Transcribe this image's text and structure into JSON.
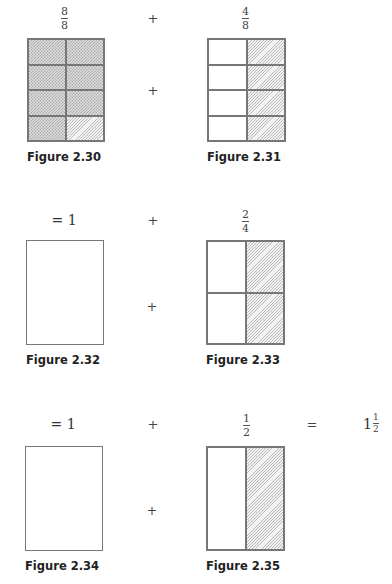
{
  "rows": [
    {
      "left": {
        "label": {
          "numerator": "8",
          "denominator": "8"
        },
        "caption": "Figure 2.30",
        "grid": {
          "rows": 4,
          "cols": 2,
          "shaded": "7 crosshatched, 1 diagonal (bottom-right)"
        }
      },
      "operator_top": "+",
      "operator_mid": "+",
      "right": {
        "label": {
          "numerator": "4",
          "denominator": "8"
        },
        "caption": "Figure 2.31",
        "grid": {
          "rows": 4,
          "cols": 2,
          "shaded": "right column diagonal"
        }
      }
    },
    {
      "left": {
        "label": "= 1",
        "caption": "Figure 2.32",
        "grid": {
          "rows": 1,
          "cols": 1,
          "shaded": "none"
        }
      },
      "operator_top": "+",
      "operator_mid": "+",
      "right": {
        "label": {
          "numerator": "2",
          "denominator": "4"
        },
        "caption": "Figure 2.33",
        "grid": {
          "rows": 2,
          "cols": 2,
          "shaded": "right column diagonal"
        }
      }
    },
    {
      "left": {
        "label": "= 1",
        "caption": "Figure 2.34",
        "grid": {
          "rows": 1,
          "cols": 1,
          "shaded": "none"
        }
      },
      "operator_top": "+",
      "operator_mid": "+",
      "right": {
        "label": {
          "numerator": "1",
          "denominator": "2"
        },
        "caption": "Figure 2.35",
        "grid": {
          "rows": 1,
          "cols": 2,
          "shaded": "right column diagonal"
        }
      },
      "equals": "=",
      "result": {
        "whole": "1",
        "numerator": "1",
        "denominator": "2"
      }
    }
  ]
}
